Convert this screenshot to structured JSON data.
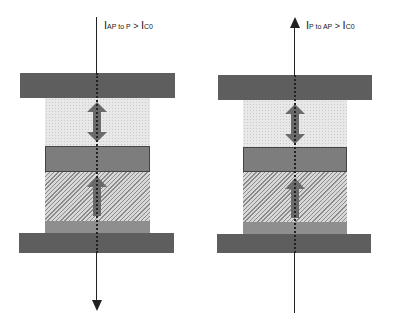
{
  "panels": [
    {
      "id": "left",
      "current_direction": "down",
      "label": {
        "main": "I",
        "sub": "AP to P",
        "op": " > ",
        "main2": "I",
        "sub2": "C0"
      }
    },
    {
      "id": "right",
      "current_direction": "up",
      "label": {
        "main": "I",
        "sub": "P to AP",
        "op": " > ",
        "main2": "I",
        "sub2": "C0"
      }
    }
  ],
  "layers": [
    "top-electrode",
    "free-layer",
    "tunnel-barrier",
    "pinned-layer",
    "seed-layer",
    "bottom-electrode"
  ],
  "colors": {
    "electrode": "#5e5e5e",
    "free_layer": "#e8e8e8",
    "barrier": "#7d7d7d",
    "pinned_layer": "#c4c4c4",
    "seed_layer": "#8e8e8e",
    "magnetization_arrow": "#6a6a6a",
    "current_line": "#222222"
  }
}
